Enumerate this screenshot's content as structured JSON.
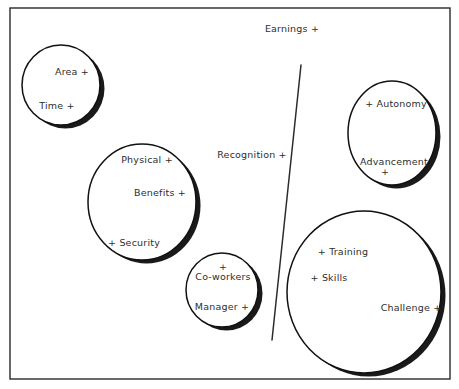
{
  "diagram": {
    "title_label": "Earnings +",
    "frame": {
      "x": 10,
      "y": 8,
      "width": 440,
      "height": 371
    },
    "divider": {
      "label": "divider-line",
      "x1": 301,
      "y1": 65,
      "x2": 272,
      "y2": 340
    },
    "free_labels": [
      {
        "name": "earnings-label",
        "text": "Earnings +",
        "x": 292,
        "y": 24
      },
      {
        "name": "recognition-label",
        "text": "Recognition +",
        "x": 252,
        "y": 150
      }
    ],
    "bubbles": [
      {
        "name": "bubble-area-time",
        "cx": 61,
        "cy": 85,
        "rx": 39,
        "ry": 40,
        "items": [
          {
            "name": "label-area",
            "text": "Area +",
            "x": 72,
            "y": 67
          },
          {
            "name": "label-time",
            "text": "Time +",
            "x": 57,
            "y": 101
          }
        ]
      },
      {
        "name": "bubble-physical-benefits-security",
        "cx": 142,
        "cy": 202,
        "rx": 54,
        "ry": 58,
        "items": [
          {
            "name": "label-physical",
            "text": "Physical +",
            "x": 147,
            "y": 155
          },
          {
            "name": "label-benefits",
            "text": "Benefits +",
            "x": 160,
            "y": 188
          },
          {
            "name": "label-security",
            "text": "+ Security",
            "x": 134,
            "y": 238
          }
        ]
      },
      {
        "name": "bubble-coworkers-manager",
        "cx": 222,
        "cy": 290,
        "rx": 36,
        "ry": 37,
        "items": [
          {
            "name": "label-coworkers-plus",
            "text": "+",
            "x": 223,
            "y": 262
          },
          {
            "name": "label-coworkers",
            "text": "Co-workers",
            "x": 223,
            "y": 272
          },
          {
            "name": "label-manager",
            "text": "Manager +",
            "x": 222,
            "y": 302
          }
        ]
      },
      {
        "name": "bubble-autonomy-advancement",
        "cx": 392,
        "cy": 133,
        "rx": 44,
        "ry": 52,
        "items": [
          {
            "name": "label-autonomy",
            "text": "+ Autonomy",
            "x": 396,
            "y": 99
          },
          {
            "name": "label-advancement",
            "text": "Advancement",
            "x": 394,
            "y": 157
          },
          {
            "name": "label-advancement-plus",
            "text": "+",
            "x": 385,
            "y": 167
          }
        ]
      },
      {
        "name": "bubble-training-skills-challenge",
        "cx": 364,
        "cy": 292,
        "rx": 77,
        "ry": 81,
        "items": [
          {
            "name": "label-training",
            "text": "+ Training",
            "x": 343,
            "y": 247
          },
          {
            "name": "label-skills",
            "text": "+ Skills",
            "x": 329,
            "y": 273
          },
          {
            "name": "label-challenge",
            "text": "Challenge +",
            "x": 411,
            "y": 303
          }
        ]
      }
    ],
    "colors": {
      "background": "#ffffff",
      "frame_stroke": "#2a2a2a",
      "bubble_stroke": "#111111",
      "bubble_fill": "#ffffff",
      "shadow": "#1a1a1a",
      "text": "#2e2e2e"
    }
  }
}
